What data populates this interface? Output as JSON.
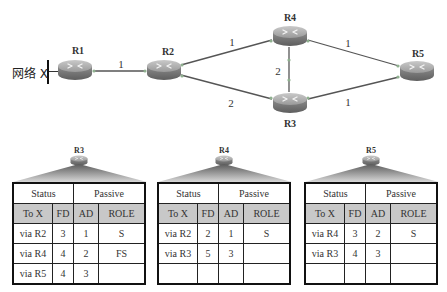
{
  "topology": {
    "network_label": "网络 X",
    "routers": [
      {
        "id": "R1",
        "label": "R1",
        "x": 75,
        "y": 69
      },
      {
        "id": "R2",
        "label": "R2",
        "x": 164,
        "y": 70
      },
      {
        "id": "R4",
        "label": "R4",
        "x": 290,
        "y": 36
      },
      {
        "id": "R3",
        "label": "R3",
        "x": 290,
        "y": 103
      },
      {
        "id": "R5",
        "label": "R5",
        "x": 417,
        "y": 70
      }
    ],
    "links": [
      {
        "from": "R1",
        "to": "R2",
        "cost": "1"
      },
      {
        "from": "R2",
        "to": "R4",
        "cost": "1"
      },
      {
        "from": "R2",
        "to": "R3",
        "cost": "2"
      },
      {
        "from": "R4",
        "to": "R3",
        "cost": "2"
      },
      {
        "from": "R4",
        "to": "R5",
        "cost": "1"
      },
      {
        "from": "R3",
        "to": "R5",
        "cost": "1"
      }
    ]
  },
  "tables": [
    {
      "router": "R3",
      "status_label": "Status",
      "status_value": "Passive",
      "headers": [
        "To X",
        "FD",
        "AD",
        "ROLE"
      ],
      "rows": [
        [
          "via R2",
          "3",
          "1",
          "S"
        ],
        [
          "via R4",
          "4",
          "2",
          "FS"
        ],
        [
          "via R5",
          "4",
          "3",
          ""
        ]
      ]
    },
    {
      "router": "R4",
      "status_label": "Status",
      "status_value": "Passive",
      "headers": [
        "To X",
        "FD",
        "AD",
        "ROLE"
      ],
      "rows": [
        [
          "via R2",
          "2",
          "1",
          "S"
        ],
        [
          "via R3",
          "5",
          "3",
          ""
        ],
        [
          "",
          "",
          "",
          ""
        ]
      ]
    },
    {
      "router": "R5",
      "status_label": "Status",
      "status_value": "Passive",
      "headers": [
        "To X",
        "FD",
        "AD",
        "ROLE"
      ],
      "rows": [
        [
          "via R4",
          "3",
          "2",
          "S"
        ],
        [
          "via R3",
          "4",
          "3",
          ""
        ],
        [
          "",
          "",
          "",
          ""
        ]
      ]
    }
  ],
  "colors": {
    "header_bg": "#c8c8c8",
    "router_body": "#8a8a8a",
    "link": "#555555"
  }
}
